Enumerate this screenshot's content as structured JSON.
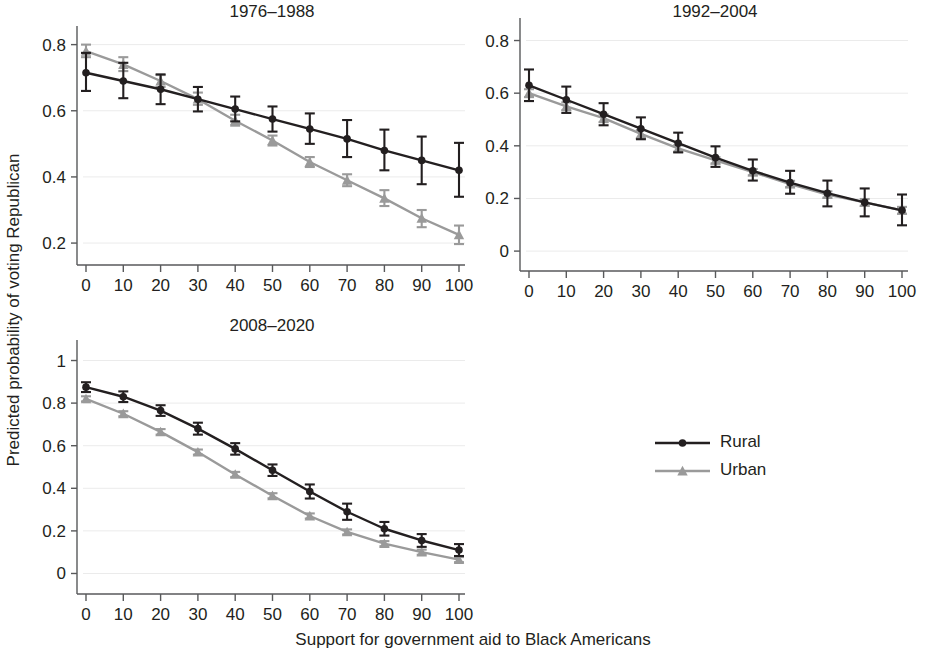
{
  "figure": {
    "xlabel": "Support for government aid to Black Americans",
    "ylabel": "Predicted probability of voting Republican",
    "legend": {
      "position": "center-right",
      "entries": [
        {
          "label": "Rural",
          "color": "#231f20",
          "marker": "circle"
        },
        {
          "label": "Urban",
          "color": "#9a9a9a",
          "marker": "triangle"
        }
      ]
    }
  },
  "chart_data": [
    {
      "type": "line",
      "panel": "top-left",
      "title": "1976–1988",
      "xlabel": "Support for government aid to Black Americans",
      "ylabel": "Predicted probability of voting Republican",
      "x": [
        0,
        10,
        20,
        30,
        40,
        50,
        60,
        70,
        80,
        90,
        100
      ],
      "xlim": [
        0,
        100
      ],
      "ylim": [
        0.17,
        0.82
      ],
      "yticks": [
        0.2,
        0.4,
        0.6,
        0.8
      ],
      "ytick_labels": [
        "0.2",
        "0.4",
        "0.6",
        "0.8"
      ],
      "xticks": [
        0,
        10,
        20,
        30,
        40,
        50,
        60,
        70,
        80,
        90,
        100
      ],
      "xtick_labels": [
        "0",
        "10",
        "20",
        "30",
        "40",
        "50",
        "60",
        "70",
        "80",
        "90",
        "100"
      ],
      "grid": true,
      "series": [
        {
          "name": "Rural",
          "color": "#231f20",
          "marker": "circle",
          "values": [
            0.715,
            0.69,
            0.665,
            0.635,
            0.605,
            0.575,
            0.545,
            0.515,
            0.48,
            0.45,
            0.42
          ],
          "ci_low": [
            0.66,
            0.638,
            0.62,
            0.598,
            0.568,
            0.537,
            0.5,
            0.46,
            0.42,
            0.378,
            0.34
          ],
          "ci_high": [
            0.775,
            0.745,
            0.71,
            0.672,
            0.643,
            0.613,
            0.592,
            0.572,
            0.543,
            0.522,
            0.503
          ]
        },
        {
          "name": "Urban",
          "color": "#9a9a9a",
          "marker": "triangle",
          "values": [
            0.78,
            0.74,
            0.69,
            0.635,
            0.57,
            0.51,
            0.445,
            0.39,
            0.335,
            0.275,
            0.225
          ],
          "ci_low": [
            0.762,
            0.72,
            0.672,
            0.618,
            0.555,
            0.495,
            0.43,
            0.372,
            0.312,
            0.248,
            0.197
          ],
          "ci_high": [
            0.8,
            0.762,
            0.708,
            0.655,
            0.588,
            0.525,
            0.46,
            0.408,
            0.36,
            0.3,
            0.253
          ]
        }
      ]
    },
    {
      "type": "line",
      "panel": "top-right",
      "title": "1992–2004",
      "xlabel": "Support for government aid to Black Americans",
      "ylabel": "Predicted probability of voting Republican",
      "x": [
        0,
        10,
        20,
        30,
        40,
        50,
        60,
        70,
        80,
        90,
        100
      ],
      "xlim": [
        0,
        100
      ],
      "ylim": [
        -0.03,
        0.84
      ],
      "yticks": [
        0,
        0.2,
        0.4,
        0.6,
        0.8
      ],
      "ytick_labels": [
        "0",
        "0.2",
        "0.4",
        "0.6",
        "0.8"
      ],
      "xticks": [
        0,
        10,
        20,
        30,
        40,
        50,
        60,
        70,
        80,
        90,
        100
      ],
      "xtick_labels": [
        "0",
        "10",
        "20",
        "30",
        "40",
        "50",
        "60",
        "70",
        "80",
        "90",
        "100"
      ],
      "grid": true,
      "series": [
        {
          "name": "Rural",
          "color": "#231f20",
          "marker": "circle",
          "values": [
            0.63,
            0.575,
            0.52,
            0.465,
            0.41,
            0.355,
            0.305,
            0.26,
            0.22,
            0.185,
            0.155
          ],
          "ci_low": [
            0.57,
            0.525,
            0.478,
            0.425,
            0.375,
            0.32,
            0.268,
            0.218,
            0.17,
            0.132,
            0.098
          ],
          "ci_high": [
            0.69,
            0.625,
            0.562,
            0.508,
            0.45,
            0.398,
            0.348,
            0.305,
            0.268,
            0.238,
            0.215
          ]
        },
        {
          "name": "Urban",
          "color": "#9a9a9a",
          "marker": "triangle",
          "values": [
            0.6,
            0.55,
            0.505,
            0.445,
            0.39,
            0.345,
            0.3,
            0.255,
            0.215,
            0.185,
            0.155
          ],
          "ci_low": [
            0.585,
            0.535,
            0.49,
            0.43,
            0.378,
            0.333,
            0.288,
            0.243,
            0.203,
            0.172,
            0.142
          ],
          "ci_high": [
            0.615,
            0.565,
            0.52,
            0.46,
            0.402,
            0.357,
            0.312,
            0.267,
            0.227,
            0.198,
            0.168
          ]
        }
      ]
    },
    {
      "type": "line",
      "panel": "bottom-left",
      "title": "2008–2020",
      "xlabel": "Support for government aid to Black Americans",
      "ylabel": "Predicted probability of voting Republican",
      "x": [
        0,
        10,
        20,
        30,
        40,
        50,
        60,
        70,
        80,
        90,
        100
      ],
      "xlim": [
        0,
        100
      ],
      "ylim": [
        -0.04,
        1.04
      ],
      "yticks": [
        0,
        0.2,
        0.4,
        0.6,
        0.8,
        1
      ],
      "ytick_labels": [
        "0",
        "0.2",
        "0.4",
        "0.6",
        "0.8",
        "1"
      ],
      "xticks": [
        0,
        10,
        20,
        30,
        40,
        50,
        60,
        70,
        80,
        90,
        100
      ],
      "xtick_labels": [
        "0",
        "10",
        "20",
        "30",
        "40",
        "50",
        "60",
        "70",
        "80",
        "90",
        "100"
      ],
      "grid": true,
      "series": [
        {
          "name": "Rural",
          "color": "#231f20",
          "marker": "circle",
          "values": [
            0.875,
            0.83,
            0.765,
            0.68,
            0.585,
            0.485,
            0.385,
            0.29,
            0.21,
            0.155,
            0.11
          ],
          "ci_low": [
            0.852,
            0.805,
            0.74,
            0.652,
            0.558,
            0.458,
            0.352,
            0.252,
            0.178,
            0.125,
            0.082
          ],
          "ci_high": [
            0.898,
            0.855,
            0.79,
            0.708,
            0.612,
            0.512,
            0.418,
            0.328,
            0.242,
            0.185,
            0.138
          ]
        },
        {
          "name": "Urban",
          "color": "#9a9a9a",
          "marker": "triangle",
          "values": [
            0.82,
            0.75,
            0.665,
            0.57,
            0.465,
            0.365,
            0.27,
            0.195,
            0.14,
            0.1,
            0.065
          ],
          "ci_low": [
            0.808,
            0.738,
            0.652,
            0.558,
            0.453,
            0.353,
            0.258,
            0.183,
            0.128,
            0.088,
            0.053
          ],
          "ci_high": [
            0.832,
            0.762,
            0.678,
            0.582,
            0.477,
            0.377,
            0.282,
            0.207,
            0.152,
            0.112,
            0.077
          ]
        }
      ]
    }
  ]
}
